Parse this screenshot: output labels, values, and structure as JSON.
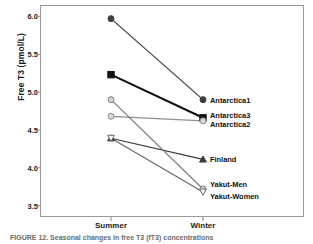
{
  "chart_data": {
    "type": "line",
    "title": "",
    "xlabel": "",
    "ylabel": "Free T3 (pmol/L)",
    "categories": [
      "Summer",
      "Winter"
    ],
    "ylim": [
      3.35,
      6.15
    ],
    "yticks": [
      "6.0",
      "5.5",
      "5.0",
      "4.5",
      "4.0",
      "3.5"
    ],
    "ytick_values": [
      6.0,
      5.5,
      5.0,
      4.5,
      4.0,
      3.5
    ],
    "grid": false,
    "legend_position": "right-inline-labels",
    "series": [
      {
        "name": "Antarctica1",
        "values": [
          5.97,
          4.9
        ],
        "marker": "circle-filled",
        "color": "#3f3f3f"
      },
      {
        "name": "Antarctica3",
        "values": [
          5.23,
          4.66
        ],
        "marker": "square-filled",
        "color": "#111111"
      },
      {
        "name": "Antarctica2",
        "values": [
          4.68,
          4.62
        ],
        "marker": "circle-light",
        "color": "#8f8f8f"
      },
      {
        "name": "Finland",
        "values": [
          4.39,
          4.11
        ],
        "marker": "triangle-filled",
        "color": "#3a3a3a"
      },
      {
        "name": "Yakut-Men",
        "values": [
          4.9,
          3.72
        ],
        "marker": "circle-light",
        "color": "#7d7d7d"
      },
      {
        "name": "Yakut-Women",
        "values": [
          4.39,
          3.68
        ],
        "marker": "triangle-open",
        "color": "#6a6a6a"
      }
    ]
  },
  "axis": {
    "y_title": "Free T3 (pmol/L)"
  },
  "caption": {
    "text": "FIGURE 12.   Seasonal changes in free T3 (fT3) concentrations"
  }
}
